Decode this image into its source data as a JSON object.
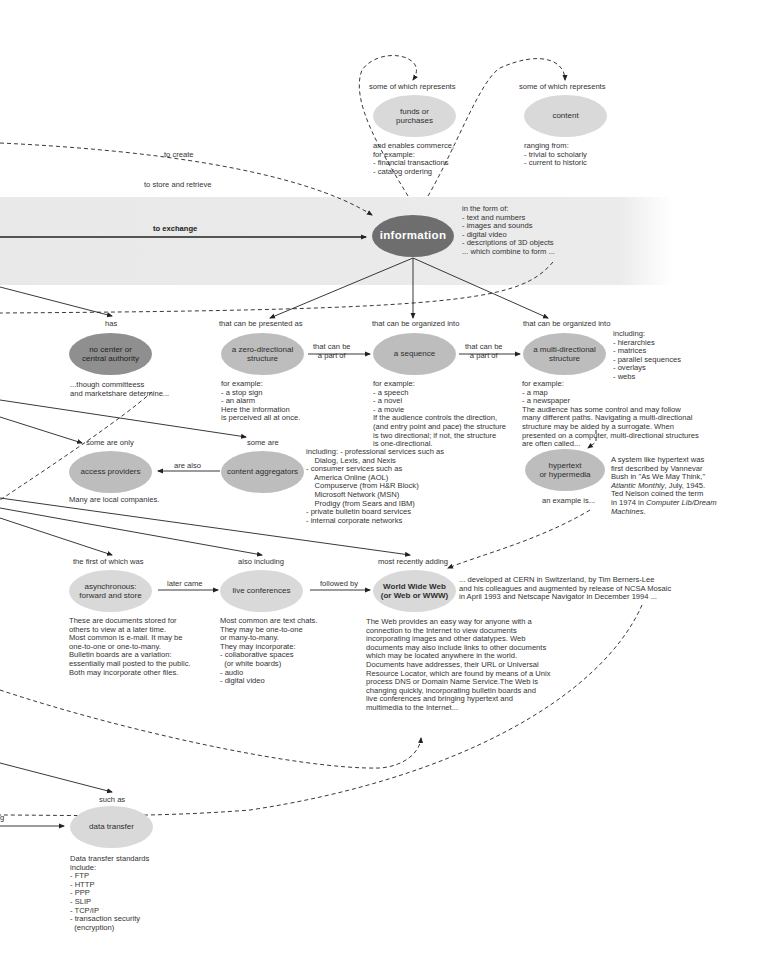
{
  "diagram": {
    "nodes": {
      "funds": "funds or\npurchases",
      "content": "content",
      "information": "information",
      "no_center": "no center or\ncentral authority",
      "zero_dir": "a zero-directional\nstructure",
      "sequence": "a sequence",
      "multi_dir": "a multi-directional\nstructure",
      "hypertext": "hypertext\nor hypermedia",
      "access_providers": "access providers",
      "content_aggregators": "content aggregators",
      "async": "asynchronous:\nforward and store",
      "live_conf": "live conferences",
      "www": "World Wide Web\n(or Web or WWW)",
      "data_transfer": "data transfer"
    },
    "edge_labels": {
      "funds_represents": "some of which represents",
      "content_represents": "some of which represents",
      "to_create": "to create",
      "to_store": "to store and retrieve",
      "to_exchange": "to exchange",
      "has": "has",
      "presented_as": "that can be presented as",
      "organized_into_1": "that can be organized into",
      "organized_into_2": "that can be organized into",
      "part_of_1": "that can be\na part of",
      "part_of_2": "that can be\na part of",
      "some_only": "some are only",
      "some_are": "some are",
      "are_also": "are also",
      "first_was": "the first of which was",
      "also_including": "also including",
      "most_recently": "most recently adding",
      "later_came": "later came",
      "followed_by": "followed by",
      "such_as": "such as",
      "an_example": "an example is...",
      "left_cut": "g"
    },
    "descriptions": {
      "funds": "and enables commerce,\nfor example:\n- financial transactions\n- catalog ordering",
      "content": "ranging from:\n- trivial to scholarly\n- current to historic",
      "information": "in the form of:\n- text and numbers\n- images and sounds\n- digital video\n- descriptions of 3D objects\n... which combine to form ...",
      "no_center": "...though committeess\nand marketshare determine...",
      "zero_dir": "for example:\n- a stop sign\n- an alarm\nHere the information\nis perceived all at once.",
      "sequence": "for example:\n- a speech\n- a novel\n- a movie\nIf the audience controls the direction,\n(and entry point and pace) the structure\nis two directional; if not, the structure\nis one-directional.",
      "multi_dir_including": "including:\n- hierarchies\n- matrices\n- parallel sequences\n- overlays\n- webs",
      "multi_dir": "for example:\n- a map\n- a newspaper\nThe audience has some control and may follow\nmany different paths. Navigating a multi-directional\nstructure may be aided by a surrogate. When\npresented on a computer, multi-directional structures\nare often called...",
      "hypertext_a": "A system like hypertext was\nfirst described by Vannevar\nBush in \"As We May Think,\"",
      "hypertext_b": "Atlantic Monthly",
      "hypertext_c": ", July, 1945.\nTed Nelson coined the term\nin 1974 in ",
      "hypertext_d": "Computer Lib/Dream\nMachines",
      "hypertext_e": ".",
      "access_providers": "Many are local companies.",
      "content_aggregators": "including: - professional services such as\n    Dialog, Lexis, and Nexis\n- consumer services such as\n    America Online (AOL)\n    Compuserve (from H&R Block)\n    Microsoft Network (MSN)\n    Prodigy (from Sears and IBM)\n- private bulletin board services\n- internal corporate networks",
      "async": "These are documents stored for\nothers to view at a later time.\nMost common is e-mail. It may be\none-to-one or one-to-many.\nBulletin boards are a variation:\nessentially mail posted to the public.\nBoth may incorporate other files.",
      "live_conf": "Most common are text chats.\nThey may be one-to-one\nor many-to-many.\nThey may incorporate:\n- collaborative spaces\n  (or white boards)\n- audio\n- digital video",
      "www_history": "... developed at CERN in Switzerland, by Tim Berners-Lee\nand his colleagues and augmented by release of NCSA Mosaic\nin April 1993 and Netscape Navigator in December 1994 ...",
      "www": "The Web provides an easy way for anyone with a\nconnection to the Internet to view documents\nincorporating images and other datatypes. Web\ndocuments may also include links to other documents\nwhich may be located anywhere in the world.\nDocuments have addresses, their URL or Universal\nResource Locator, which are found by means of a Unix\nprocess DNS or Domain Name Service.The Web is\nchanging quickly, incorporating bulletin boards and\nlive conferences and bringing hypertext and\nmultimedia to the Internet...",
      "data_transfer": "Data transfer standards\ninclude:\n- FTP\n- HTTP\n- PPP\n- SLIP\n- TCP/IP\n- transaction security\n  (encryption)"
    },
    "colors": {
      "band": "#ebebeb",
      "main_node": "#6e6e6e",
      "dark_node": "#8f8f8f",
      "node": "#c8c8c8",
      "light_node": "#d9d9d9",
      "line": "#222222"
    }
  }
}
